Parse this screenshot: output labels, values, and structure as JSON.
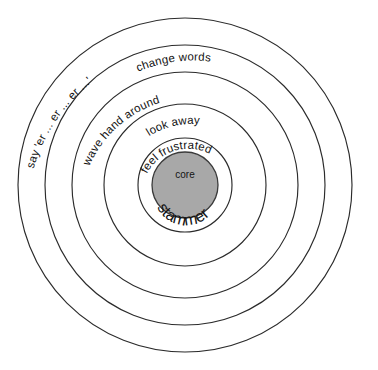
{
  "diagram": {
    "type": "concentric-rings",
    "background_color": "#ffffff",
    "stroke_color": "#2b2b2b",
    "core_fill_color": "#a8a8a8",
    "center": {
      "x": 185,
      "y": 185
    },
    "rings": [
      {
        "id": "ring-5-outer",
        "order": 5,
        "label": "say 'er ... er ... er ...'",
        "radius": 167,
        "label_font_size": 11.5
      },
      {
        "id": "ring-4",
        "order": 4,
        "label": "change words",
        "radius": 140,
        "label_font_size": 11.5
      },
      {
        "id": "ring-3",
        "order": 3,
        "label": "wave hand around",
        "radius": 113,
        "label_font_size": 11.5
      },
      {
        "id": "ring-2",
        "order": 2,
        "label": "look away",
        "radius": 81,
        "label_font_size": 11.5
      },
      {
        "id": "ring-1",
        "order": 1,
        "label": "feel frustrated",
        "radius": 47,
        "label_font_size": 11.5
      }
    ],
    "core": {
      "id": "core",
      "radius": 33,
      "fill_color": "#a8a8a8",
      "top_label": "core",
      "top_label_font_size": 10,
      "bottom_label": "stammer",
      "bottom_label_font_size": 16
    }
  }
}
